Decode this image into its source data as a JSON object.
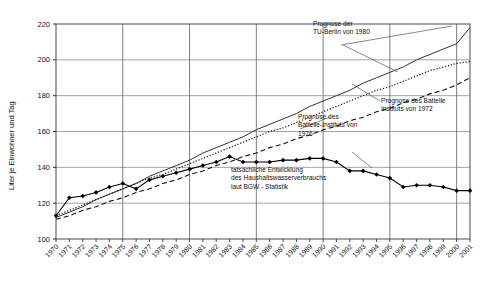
{
  "chart_data": {
    "type": "line",
    "title": "",
    "xlabel": "",
    "ylabel": "Liter je Einwohner und Tag",
    "ylim": [
      100,
      220
    ],
    "ytick_labels": [
      "220",
      "200",
      "180",
      "160",
      "140",
      "120",
      "100"
    ],
    "yticks": [
      220,
      200,
      180,
      160,
      140,
      120,
      100
    ],
    "grid": true,
    "legend_position": "none",
    "x": [
      1970,
      1971,
      1972,
      1973,
      1974,
      1975,
      1976,
      1977,
      1978,
      1979,
      1980,
      1981,
      1982,
      1983,
      1984,
      1985,
      1986,
      1987,
      1988,
      1989,
      1990,
      1991,
      1992,
      1993,
      1994,
      1995,
      1996,
      1997,
      1998,
      1999,
      2000,
      2001
    ],
    "xtick_labels": [
      "1970",
      "1971",
      "1972",
      "1973",
      "1974",
      "1975",
      "1976",
      "1977",
      "1978",
      "1979",
      "1980",
      "1981",
      "1982",
      "1983",
      "1984",
      "1985",
      "1986",
      "1987",
      "1988",
      "1989",
      "1990",
      "1991",
      "1992",
      "1993",
      "1994",
      "1995",
      "1996",
      "1997",
      "1998",
      "1999",
      "2000",
      "2001"
    ],
    "series": [
      {
        "name": "tatsächliche Entwicklung des Haushaltswasserverbrauchs laut BGW - Statistik",
        "style": "solid-markers",
        "color": "#000000",
        "values": [
          113,
          123,
          124,
          126,
          129,
          131,
          128,
          133,
          135,
          137,
          139,
          141,
          143,
          146,
          143,
          143,
          143,
          144,
          144,
          145,
          145,
          143,
          138,
          138,
          136,
          134,
          129,
          130,
          130,
          129,
          127,
          127
        ]
      },
      {
        "name": "Prognose der TU-Berlin von 1980",
        "style": "solid",
        "color": "#333333",
        "values": [
          112,
          115,
          118,
          122,
          125,
          128,
          131,
          135,
          138,
          141,
          144,
          148,
          151,
          154,
          157,
          161,
          164,
          167,
          170,
          174,
          177,
          180,
          183,
          187,
          190,
          193,
          196,
          200,
          203,
          206,
          209,
          218
        ]
      },
      {
        "name": "Prognose des Battelle-Instituts von 1976",
        "style": "dotted",
        "color": "#111111",
        "values": [
          113,
          116,
          119,
          122,
          125,
          128,
          131,
          134,
          136,
          139,
          142,
          145,
          148,
          151,
          154,
          157,
          160,
          162,
          165,
          168,
          171,
          174,
          177,
          180,
          183,
          185,
          188,
          191,
          194,
          196,
          198,
          199
        ]
      },
      {
        "name": "Prognose des Battelle Instituts von 1972",
        "style": "dashed",
        "color": "#111111",
        "values": [
          111,
          113,
          116,
          118,
          121,
          123,
          126,
          128,
          131,
          133,
          136,
          138,
          141,
          143,
          146,
          148,
          151,
          153,
          156,
          158,
          161,
          163,
          166,
          168,
          171,
          173,
          176,
          178,
          181,
          183,
          186,
          190
        ]
      }
    ],
    "annotations": [
      {
        "id": "anno-tu-berlin",
        "lines": [
          "Prognose der",
          "TU-Berlin von 1980"
        ],
        "x": 313,
        "y": 26
      },
      {
        "id": "anno-battelle-1972",
        "lines": [
          "Prognose des Battelle",
          "Instituts von 1972"
        ],
        "x": 381,
        "y": 103
      },
      {
        "id": "anno-battelle-1976",
        "lines": [
          "Prognose des",
          "Battelle-Instituts von",
          "1976"
        ],
        "x": 298,
        "y": 119
      },
      {
        "id": "anno-actual",
        "lines": [
          "tatsächliche Entwicklung",
          "des Haushaltswasserverbrauchs",
          "laut BGW - Statistik"
        ],
        "x": 231,
        "y": 172
      }
    ]
  }
}
